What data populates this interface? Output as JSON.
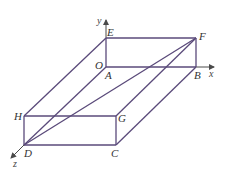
{
  "diagram": {
    "title": "",
    "type": "3d-rectangular-box",
    "colors": {
      "edge": "#5a4a7a",
      "axis": "#4a4a4a",
      "label": "#333333"
    },
    "axes": [
      {
        "name": "x",
        "label": "x"
      },
      {
        "name": "y",
        "label": "y"
      },
      {
        "name": "z",
        "label": "z"
      }
    ],
    "origin_label": "O",
    "vertices": [
      {
        "id": "A",
        "label": "A"
      },
      {
        "id": "B",
        "label": "B"
      },
      {
        "id": "C",
        "label": "C"
      },
      {
        "id": "D",
        "label": "D"
      },
      {
        "id": "E",
        "label": "E"
      },
      {
        "id": "F",
        "label": "F"
      },
      {
        "id": "G",
        "label": "G"
      },
      {
        "id": "H",
        "label": "H"
      }
    ],
    "edges": [
      "AB",
      "BC",
      "CD",
      "DA",
      "EF",
      "FG",
      "GH",
      "HE",
      "AE",
      "BF",
      "CG",
      "DH",
      "DF"
    ]
  }
}
